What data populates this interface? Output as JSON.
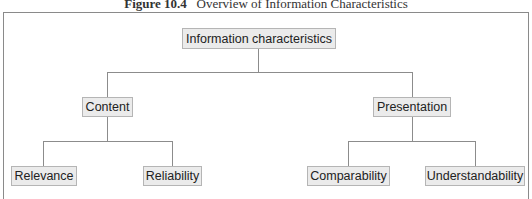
{
  "caption": {
    "label": "Figure 10.4",
    "title": "Overview of Information Characteristics"
  },
  "tree": {
    "root": "Information characteristics",
    "level1": [
      {
        "label": "Content",
        "children": [
          "Relevance",
          "Reliability"
        ]
      },
      {
        "label": "Presentation",
        "children": [
          "Comparability",
          "Understandability"
        ]
      }
    ]
  }
}
